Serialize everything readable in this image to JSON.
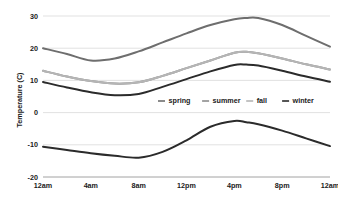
{
  "chart_data": {
    "type": "line",
    "title": "",
    "xlabel": "",
    "ylabel": "Temperature (C)",
    "ylim": [
      -20,
      30
    ],
    "xlim": [
      0,
      24
    ],
    "grid": true,
    "legend_position": "center",
    "yticks": [
      "30",
      "20",
      "10",
      "0",
      "-10",
      "-20"
    ],
    "ytick_values": [
      30,
      20,
      10,
      0,
      -10,
      -20
    ],
    "xticks": [
      "12am",
      "4am",
      "8am",
      "12pm",
      "4pm",
      "8pm",
      "12am"
    ],
    "xtick_values": [
      0,
      4,
      8,
      12,
      16,
      20,
      24
    ],
    "x": [
      0,
      2,
      4,
      6,
      8,
      10,
      12,
      14,
      16,
      17,
      18,
      20,
      22,
      24
    ],
    "series": [
      {
        "name": "spring",
        "color": "#6e6e6e",
        "values": [
          20.0,
          18.2,
          16.2,
          16.8,
          19.0,
          21.8,
          24.6,
          27.2,
          29.0,
          29.4,
          29.4,
          27.2,
          23.8,
          20.5
        ]
      },
      {
        "name": "summer",
        "color": "#8c8c8c",
        "values": [
          13.0,
          11.2,
          9.8,
          9.0,
          9.4,
          11.4,
          13.8,
          16.2,
          18.6,
          18.9,
          18.4,
          16.8,
          15.0,
          13.4
        ]
      },
      {
        "name": "fall",
        "color": "#b5b5b5",
        "values": [
          13.0,
          11.2,
          9.8,
          9.0,
          9.4,
          11.4,
          13.8,
          16.2,
          18.6,
          18.9,
          18.4,
          16.8,
          15.0,
          13.4
        ]
      },
      {
        "name": "winter",
        "color": "#2b2b2b",
        "values": [
          9.5,
          7.8,
          6.3,
          5.4,
          5.8,
          8.0,
          10.4,
          12.8,
          14.8,
          14.9,
          14.6,
          13.0,
          11.2,
          9.6
        ]
      },
      {
        "name": "winter-low",
        "color": "#2b2b2b",
        "values": [
          -10.6,
          -11.6,
          -12.6,
          -13.4,
          -14.0,
          -12.2,
          -8.6,
          -4.4,
          -2.6,
          -3.0,
          -3.6,
          -5.6,
          -8.0,
          -10.4
        ]
      }
    ],
    "legend": [
      {
        "label": "spring",
        "color": "#6e6e6e"
      },
      {
        "label": "summer",
        "color": "#8c8c8c"
      },
      {
        "label": "fall",
        "color": "#b5b5b5"
      },
      {
        "label": "winter",
        "color": "#2b2b2b"
      }
    ],
    "grid_color": "#d9d9d9",
    "axis_color": "#8c8c8c"
  }
}
